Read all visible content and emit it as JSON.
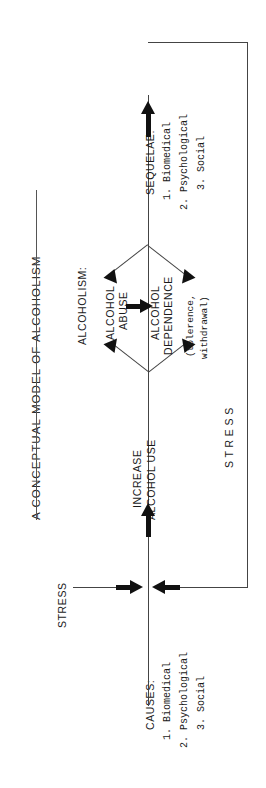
{
  "figure": {
    "title": "A CONCEPTUAL MODEL OF ALCOHOLISM",
    "orientation": "rotated-90-counterclockwise",
    "ink_color": "#1a1a1a",
    "background_color": "#ffffff"
  },
  "nodes": {
    "causes": {
      "heading": "CAUSES:",
      "items": [
        "1. Biomedical",
        "2. Psychological",
        "3. Social"
      ]
    },
    "stress_input": {
      "label": "STRESS"
    },
    "stress_feedback": {
      "label": "S T R E S S"
    },
    "increase_use": {
      "line1": "INCREASE",
      "line2": "ALCOHOL USE"
    },
    "alcoholism": {
      "heading": "ALCOHOLISM:",
      "abuse_line1": "ALCOHOL",
      "abuse_line2": "ABUSE",
      "dependence_line1": "ALCOHOL",
      "dependence_line2": "DEPENDENCE",
      "note_line1": "(tolerence,",
      "note_line2": "withdrawal)"
    },
    "sequelae": {
      "heading": "SEQUELAE:",
      "items": [
        "1. Biomedical",
        "2. Psychological",
        "3. Social"
      ]
    }
  }
}
